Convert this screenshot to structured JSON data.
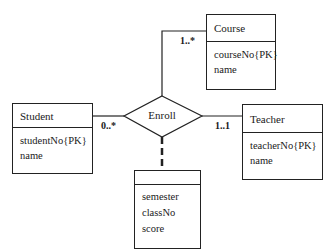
{
  "diagram": {
    "type": "UML class / ER diagram",
    "entities": [
      {
        "id": "course",
        "name": "Course",
        "attributes": [
          "courseNo{PK}",
          "name"
        ]
      },
      {
        "id": "student",
        "name": "Student",
        "attributes": [
          "studentNo{PK}",
          "name"
        ]
      },
      {
        "id": "teacher",
        "name": "Teacher",
        "attributes": [
          "teacherNo{PK}",
          "name"
        ]
      },
      {
        "id": "enroll_attrs",
        "name": "",
        "attributes": [
          "semester",
          "classNo",
          "score"
        ]
      }
    ],
    "relationship": {
      "name": "Enroll",
      "connections": [
        {
          "entity": "Course",
          "multiplicity": "1..*"
        },
        {
          "entity": "Student",
          "multiplicity": "0..*"
        },
        {
          "entity": "Teacher",
          "multiplicity": "1..1"
        }
      ],
      "association_class_link": "dashed"
    },
    "line_color": "#222222"
  }
}
